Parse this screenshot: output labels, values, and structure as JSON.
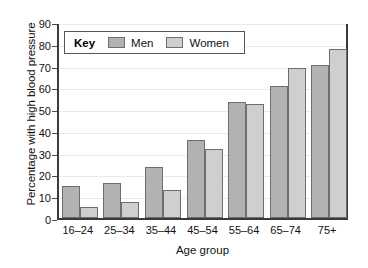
{
  "chart_data": {
    "type": "bar",
    "title": "",
    "xlabel": "Age group",
    "ylabel": "Percentage with high blood pressure",
    "categories": [
      "16–24",
      "25–34",
      "35–44",
      "45–54",
      "55–64",
      "65–74",
      "75+"
    ],
    "series": [
      {
        "name": "Men",
        "values": [
          14.5,
          16.2,
          23.2,
          35.6,
          53.4,
          60.6,
          70.3
        ],
        "color": "#b2b2b2"
      },
      {
        "name": "Women",
        "values": [
          5.0,
          7.4,
          13.0,
          31.7,
          52.5,
          69.1,
          77.4
        ],
        "color": "#cfcfcf"
      }
    ],
    "ylim": [
      0,
      90
    ],
    "yticks": [
      0,
      10,
      20,
      30,
      40,
      50,
      60,
      70,
      80,
      90
    ],
    "ytick_labels": [
      "0",
      "10",
      "20",
      "30",
      "40",
      "50",
      "60",
      "70",
      "80",
      "90"
    ],
    "grid": true,
    "grid_axis": "y",
    "legend": {
      "title": "Key",
      "position": "upper-left-inside",
      "entries": [
        "Men",
        "Women"
      ]
    },
    "axis_color": "#3a3a3a",
    "grid_color": "#e9e9e9",
    "background": "#ffffff"
  }
}
